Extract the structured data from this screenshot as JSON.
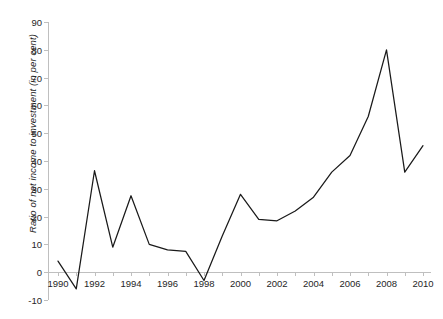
{
  "chart_data": {
    "type": "line",
    "title": "",
    "xlabel": "",
    "ylabel": "Ratio of net income to investment (in per cent)",
    "x": [
      1990,
      1991,
      1992,
      1993,
      1994,
      1995,
      1996,
      1997,
      1998,
      1999,
      2000,
      2001,
      2002,
      2003,
      2004,
      2005,
      2006,
      2007,
      2008,
      2009,
      2010
    ],
    "values": [
      4,
      -6,
      36.5,
      9,
      27.5,
      10,
      8,
      7.5,
      -3,
      13,
      28,
      19,
      18.5,
      22,
      27,
      36,
      42,
      56,
      80,
      36,
      45.5
    ],
    "series": [
      {
        "name": "Ratio of net income to investment",
        "values": [
          4,
          -6,
          36.5,
          9,
          27.5,
          10,
          8,
          7.5,
          -3,
          13,
          28,
          19,
          18.5,
          22,
          27,
          36,
          42,
          56,
          80,
          36,
          45.5
        ]
      }
    ],
    "xlim": [
      1990,
      2010
    ],
    "ylim": [
      -10,
      90
    ],
    "ytick_values": [
      -10,
      0,
      10,
      20,
      30,
      40,
      50,
      60,
      70,
      80,
      90
    ],
    "ytick_labels": [
      "-10",
      "0",
      "10",
      "20",
      "30",
      "40",
      "50",
      "60",
      "70",
      "80",
      "90"
    ],
    "xtick_values": [
      1990,
      1992,
      1994,
      1996,
      1998,
      2000,
      2002,
      2004,
      2006,
      2008,
      2010
    ],
    "xtick_labels": [
      "1990",
      "1992",
      "1994",
      "1996",
      "1998",
      "2000",
      "2002",
      "2004",
      "2006",
      "2008",
      "2010"
    ],
    "grid": false,
    "legend": false,
    "line_color": "#1a1a1a",
    "axis_color": "#bfbfbf",
    "background_color": "#ffffff"
  }
}
